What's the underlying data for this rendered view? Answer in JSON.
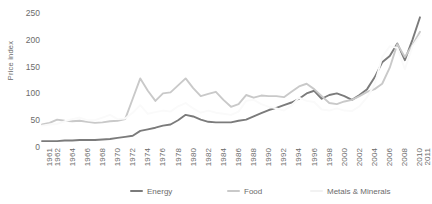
{
  "chart_data": {
    "type": "line",
    "title": "",
    "xlabel": "",
    "ylabel": "Price index",
    "ylim": [
      0,
      265
    ],
    "xlim": [
      1961,
      2011
    ],
    "grid": false,
    "legend_position": "bottom",
    "yticks": [
      0,
      50,
      100,
      150,
      200,
      250
    ],
    "ytick_labels": [
      "0",
      "50",
      "100",
      "150",
      "200",
      "250"
    ],
    "xtick_labels": [
      "1961",
      "1962",
      "1964",
      "1966",
      "1968",
      "1970",
      "1972",
      "1974",
      "1976",
      "1978",
      "1980",
      "1982",
      "1984",
      "1986",
      "1988",
      "1990",
      "1992",
      "1994",
      "1996",
      "1998",
      "2000",
      "2002",
      "2004",
      "2006",
      "2008",
      "2010",
      "2011"
    ],
    "xticks": [
      1961,
      1962,
      1964,
      1966,
      1968,
      1970,
      1972,
      1974,
      1976,
      1978,
      1980,
      1982,
      1984,
      1986,
      1988,
      1990,
      1992,
      1994,
      1996,
      1998,
      2000,
      2002,
      2004,
      2006,
      2008,
      2010,
      2011
    ],
    "x": [
      1961,
      1962,
      1963,
      1964,
      1965,
      1966,
      1967,
      1968,
      1969,
      1970,
      1971,
      1972,
      1973,
      1974,
      1975,
      1976,
      1977,
      1978,
      1979,
      1980,
      1981,
      1982,
      1983,
      1984,
      1985,
      1986,
      1987,
      1988,
      1989,
      1990,
      1991,
      1992,
      1993,
      1994,
      1995,
      1996,
      1997,
      1998,
      1999,
      2000,
      2001,
      2002,
      2003,
      2004,
      2005,
      2006,
      2007,
      2008,
      2009,
      2010,
      2011
    ],
    "series": [
      {
        "name": "Energy",
        "color": "#7b7b7b",
        "values": [
          11,
          11,
          11,
          12,
          12,
          13,
          13,
          13,
          14,
          15,
          17,
          19,
          21,
          30,
          33,
          36,
          40,
          42,
          50,
          60,
          57,
          51,
          47,
          46,
          46,
          46,
          49,
          51,
          57,
          63,
          69,
          73,
          78,
          83,
          90,
          100,
          105,
          90,
          97,
          100,
          95,
          88,
          97,
          108,
          130,
          158,
          170,
          193,
          162,
          200,
          242
        ]
      },
      {
        "name": "Food",
        "color": "#c9c9c9",
        "values": [
          42,
          45,
          51,
          49,
          48,
          49,
          47,
          45,
          46,
          48,
          49,
          52,
          90,
          128,
          105,
          86,
          100,
          102,
          115,
          128,
          110,
          95,
          99,
          103,
          88,
          75,
          80,
          97,
          92,
          96,
          95,
          95,
          93,
          103,
          113,
          118,
          108,
          95,
          82,
          80,
          85,
          88,
          95,
          103,
          108,
          118,
          148,
          192,
          168,
          190,
          215
        ]
      },
      {
        "name": "Metals & Minerals",
        "color": "#fafafa",
        "values": [
          40,
          42,
          43,
          48,
          52,
          55,
          50,
          50,
          55,
          60,
          52,
          53,
          64,
          78,
          62,
          65,
          68,
          66,
          76,
          82,
          72,
          64,
          68,
          64,
          62,
          60,
          66,
          86,
          88,
          80,
          75,
          72,
          68,
          77,
          92,
          86,
          84,
          70,
          68,
          72,
          68,
          67,
          76,
          93,
          117,
          168,
          188,
          185,
          145,
          188,
          208
        ]
      }
    ]
  },
  "legend": {
    "items": [
      {
        "label": "Energy",
        "color": "#7b7b7b"
      },
      {
        "label": "Food",
        "color": "#c9c9c9"
      },
      {
        "label": "Metals & Minerals",
        "color": "#f2f2f2"
      }
    ]
  }
}
